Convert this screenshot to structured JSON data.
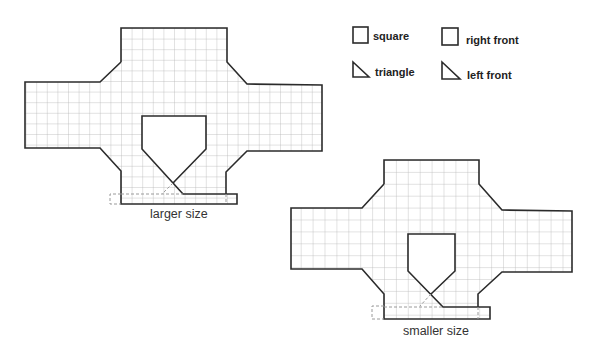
{
  "legend": {
    "items": [
      {
        "icon": "square-icon",
        "label": "square"
      },
      {
        "icon": "triangle-icon",
        "label": "triangle"
      },
      {
        "icon": "square-icon",
        "label": "right front"
      },
      {
        "icon": "triangle-icon",
        "label": "left front"
      }
    ]
  },
  "figures": [
    {
      "name": "large-template",
      "caption": "larger size"
    },
    {
      "name": "small-template",
      "caption": "smaller size"
    }
  ],
  "colors": {
    "outline": "#2b2b2b",
    "grid": "#b8b8b8",
    "dashed": "#9a9a9a",
    "background": "#ffffff"
  }
}
